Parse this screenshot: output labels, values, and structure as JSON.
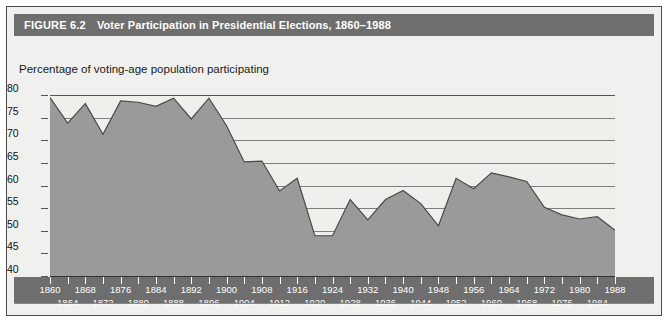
{
  "figure": {
    "number": "FIGURE 6.2",
    "title": "Voter Participation in Presidential Elections, 1860–1988",
    "subtitle": "Percentage of voting-age population participating"
  },
  "colors": {
    "title_bar": "#6e6e6e",
    "title_text": "#ffffff",
    "panel_bg": "#f0f0ee",
    "plot_bg": "#efefec",
    "area_fill": "#9a9a9a",
    "area_line": "#4a4a4a",
    "gridline": "#6a6a6a",
    "axis": "#333333",
    "border": "#4a4a4a"
  },
  "chart_data": {
    "type": "area",
    "title": "Voter Participation in Presidential Elections, 1860–1988",
    "subtitle": "Percentage of voting-age population participating",
    "xlabel": "",
    "ylabel": "Percentage of voting-age population participating",
    "ylim": [
      40,
      80
    ],
    "yticks": [
      40,
      45,
      50,
      55,
      60,
      65,
      70,
      75,
      80
    ],
    "xlim": [
      1860,
      1988
    ],
    "grid": true,
    "legend": "none",
    "x": [
      1860,
      1864,
      1868,
      1872,
      1876,
      1880,
      1884,
      1888,
      1892,
      1896,
      1900,
      1904,
      1908,
      1912,
      1916,
      1920,
      1924,
      1928,
      1932,
      1936,
      1940,
      1944,
      1948,
      1952,
      1956,
      1960,
      1964,
      1968,
      1972,
      1976,
      1980,
      1984,
      1988
    ],
    "xtick_labels_row1": [
      "1860",
      "1868",
      "1876",
      "1884",
      "1892",
      "1900",
      "1908",
      "1916",
      "1924",
      "1932",
      "1940",
      "1948",
      "1956",
      "1964",
      "1972",
      "1980",
      "1988"
    ],
    "xtick_labels_row2": [
      "1864",
      "1872",
      "1880",
      "1888",
      "1896",
      "1904",
      "1912",
      "1920",
      "1928",
      "1936",
      "1944",
      "1952",
      "1960",
      "1968",
      "1976",
      "1984"
    ],
    "values": [
      79.4,
      73.8,
      78.1,
      71.3,
      78.7,
      78.4,
      77.5,
      79.3,
      74.7,
      79.3,
      73.2,
      65.2,
      65.4,
      58.8,
      61.6,
      48.9,
      48.9,
      56.9,
      52.4,
      56.9,
      58.9,
      56.0,
      51.1,
      61.6,
      59.3,
      62.8,
      61.9,
      60.9,
      55.2,
      53.5,
      52.6,
      53.1,
      50.1
    ]
  }
}
